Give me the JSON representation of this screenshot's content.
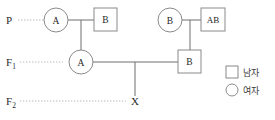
{
  "diagram": {
    "generations": [
      {
        "id": "P",
        "label": "P",
        "sub": ""
      },
      {
        "id": "F1",
        "label": "F",
        "sub": "1"
      },
      {
        "id": "F2",
        "label": "F",
        "sub": "2"
      }
    ],
    "individuals": [
      {
        "id": "p-left-female",
        "generation": "P",
        "sex": "female",
        "shape": "circle",
        "genotype": "A"
      },
      {
        "id": "p-left-male",
        "generation": "P",
        "sex": "male",
        "shape": "square",
        "genotype": "B"
      },
      {
        "id": "p-right-female",
        "generation": "P",
        "sex": "female",
        "shape": "circle",
        "genotype": "B"
      },
      {
        "id": "p-right-male",
        "generation": "P",
        "sex": "male",
        "shape": "square",
        "genotype": "AB"
      },
      {
        "id": "f1-female",
        "generation": "F1",
        "sex": "female",
        "shape": "circle",
        "genotype": "A"
      },
      {
        "id": "f1-male",
        "generation": "F1",
        "sex": "male",
        "shape": "square",
        "genotype": "B"
      },
      {
        "id": "f2-offspring",
        "generation": "F2",
        "sex": "unknown",
        "shape": "none",
        "genotype": "X"
      }
    ],
    "legend": {
      "items": [
        {
          "id": "legend-male",
          "shape": "square",
          "label": "남자"
        },
        {
          "id": "legend-female",
          "shape": "circle",
          "label": "여자"
        }
      ]
    },
    "colors": {
      "stroke": "#8a8a8a",
      "connector": "#6f6f6f",
      "guideline": "#b9b9b9",
      "text": "#2b2b2b",
      "background": "#ffffff"
    }
  }
}
